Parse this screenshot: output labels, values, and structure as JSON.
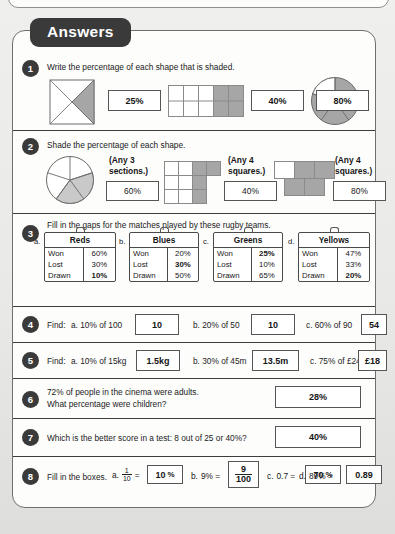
{
  "header": {
    "tab_label": "Answers"
  },
  "questions": [
    {
      "num": "1",
      "prompt": "Write the percentage of each shape that is shaded.",
      "answers": [
        "25%",
        "40%",
        "80%"
      ]
    },
    {
      "num": "2",
      "prompt": "Shade the percentage of each shape.",
      "captions": [
        "(Any 3\nsections.)",
        "(Any 4\nsquares.)",
        "(Any 4\nsquares.)"
      ],
      "caption_lines": [
        [
          "(Any 3",
          "sections.)"
        ],
        [
          "(Any 4",
          "squares.)"
        ],
        [
          "(Any 4",
          "squares.)"
        ]
      ],
      "answers": [
        "60%",
        "40%",
        "80%"
      ]
    },
    {
      "num": "3",
      "prompt": "Fill in the gaps for the matches played by these rugby teams.",
      "teams": [
        {
          "letter": "a.",
          "name": "Reds",
          "rows": [
            {
              "key": "Won",
              "value": "60%",
              "bold": false
            },
            {
              "key": "Lost",
              "value": "30%",
              "bold": false
            },
            {
              "key": "Drawn",
              "value": "10%",
              "bold": true
            }
          ]
        },
        {
          "letter": "b.",
          "name": "Blues",
          "rows": [
            {
              "key": "Won",
              "value": "20%",
              "bold": false
            },
            {
              "key": "Lost",
              "value": "30%",
              "bold": true
            },
            {
              "key": "Drawn",
              "value": "50%",
              "bold": false
            }
          ]
        },
        {
          "letter": "c.",
          "name": "Greens",
          "rows": [
            {
              "key": "Won",
              "value": "25%",
              "bold": true
            },
            {
              "key": "Lost",
              "value": "10%",
              "bold": false
            },
            {
              "key": "Drawn",
              "value": "65%",
              "bold": false
            }
          ]
        },
        {
          "letter": "d.",
          "name": "Yellows",
          "rows": [
            {
              "key": "Won",
              "value": "47%",
              "bold": false
            },
            {
              "key": "Lost",
              "value": "33%",
              "bold": false
            },
            {
              "key": "Drawn",
              "value": "20%",
              "bold": true
            }
          ]
        }
      ]
    },
    {
      "num": "4",
      "label": "Find:",
      "parts": [
        {
          "text": "a. 10% of 100",
          "answer": "10"
        },
        {
          "text": "b. 20% of 50",
          "answer": "10"
        },
        {
          "text": "c. 60% of 90",
          "answer": "54"
        }
      ]
    },
    {
      "num": "5",
      "label": "Find:",
      "parts": [
        {
          "text": "a. 10% of 15kg",
          "answer": "1.5kg"
        },
        {
          "text": "b. 30% of 45m",
          "answer": "13.5m"
        },
        {
          "text": "c. 75% of £24",
          "answer": "£18"
        }
      ]
    },
    {
      "num": "6",
      "prompt_line1": "72% of people in the cinema were adults.",
      "prompt_line2": "What percentage were children?",
      "answer": "28%"
    },
    {
      "num": "7",
      "prompt": "Which is the better score in a test: 8 out of 25 or 40%?",
      "answer": "40%"
    },
    {
      "num": "8",
      "label": "Fill in the boxes.",
      "parts": [
        {
          "letter": "a.",
          "frac_num": "1",
          "frac_den": "10",
          "eq": "=",
          "answer": "10",
          "suffix": "%"
        },
        {
          "letter": "b.",
          "lhs": "9% =",
          "answer_num": "9",
          "answer_den": "100"
        },
        {
          "letter": "c.",
          "lhs": "0.7 =",
          "answer": "70",
          "suffix": "%"
        },
        {
          "letter": "d.",
          "lhs": "89% =",
          "answer": "0.89"
        }
      ]
    }
  ],
  "colors": {
    "tab_bg": "#3a3a3a",
    "shade_fill": "#a6a6a6",
    "sheet_bg": "#fdfdfc",
    "page_bg": "#e8e8e6",
    "rule": "#3d3d3d"
  }
}
